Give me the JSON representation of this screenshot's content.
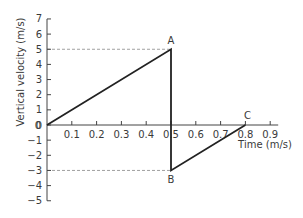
{
  "chart_data": {
    "type": "line",
    "title": "",
    "xlabel": "Time (m/s)",
    "ylabel": "Vertical velocity (m/s)",
    "xlim": [
      0,
      0.9
    ],
    "ylim": [
      -5,
      7
    ],
    "x_ticks": [
      "0.1",
      "0.2",
      "0.3",
      "0.4",
      "0.5",
      "0.6",
      "0.7",
      "0.8",
      "0.9"
    ],
    "x_tick_values": [
      0.1,
      0.2,
      0.3,
      0.4,
      0.5,
      0.6,
      0.7,
      0.8,
      0.9
    ],
    "y_ticks": [
      "7",
      "6",
      "5",
      "4",
      "3",
      "2",
      "1",
      "0",
      "−1",
      "−2",
      "−3",
      "−4",
      "−5"
    ],
    "y_tick_values": [
      7,
      6,
      5,
      4,
      3,
      2,
      1,
      0,
      -1,
      -2,
      -3,
      -4,
      -5
    ],
    "grid": false,
    "legend": null,
    "series": [
      {
        "name": "vertical velocity",
        "x": [
          0,
          0.5,
          0.5,
          0.8
        ],
        "y": [
          0,
          5,
          -3,
          0
        ],
        "color": "#222222"
      }
    ],
    "annotations": [
      {
        "label": "A",
        "x": 0.5,
        "y": 5
      },
      {
        "label": "B",
        "x": 0.5,
        "y": -3
      },
      {
        "label": "C",
        "x": 0.8,
        "y": 0
      }
    ],
    "reference_lines": [
      {
        "orientation": "horizontal",
        "y": 5,
        "x_from": 0,
        "x_to": 0.5,
        "style": "dashed"
      },
      {
        "orientation": "horizontal",
        "y": -3,
        "x_from": 0,
        "x_to": 0.5,
        "style": "dashed"
      }
    ]
  },
  "colors": {
    "axis": "#444444",
    "line": "#222222",
    "dashed": "#888888",
    "text": "#3a3a3a"
  }
}
